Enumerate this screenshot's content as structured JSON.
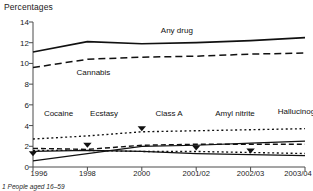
{
  "chart_data": {
    "type": "line",
    "title": "",
    "ylabel": "Percentages",
    "xlabel": "",
    "categories": [
      "1996",
      "1998",
      "2000",
      "2001/02",
      "2002/03",
      "2003/04"
    ],
    "ylim": [
      0,
      14
    ],
    "yticks": [
      0,
      2,
      4,
      6,
      8,
      10,
      12,
      14
    ],
    "grid": false,
    "legend": "inline-labels",
    "footnote": "1  People aged 16–59",
    "series": [
      {
        "name": "Any drug",
        "style": "solid",
        "values": [
          11.1,
          12.1,
          11.9,
          12.0,
          12.2,
          12.5
        ]
      },
      {
        "name": "Cannabis",
        "style": "dashed-long",
        "values": [
          9.6,
          10.4,
          10.6,
          10.7,
          10.9,
          11.0
        ]
      },
      {
        "name": "Cocaine",
        "style": "solid-rising",
        "values": [
          0.6,
          1.3,
          2.0,
          2.1,
          2.3,
          2.5
        ]
      },
      {
        "name": "Ecstasy",
        "style": "dashed",
        "values": [
          1.8,
          1.7,
          2.1,
          2.2,
          2.2,
          2.2
        ]
      },
      {
        "name": "Class A",
        "style": "dotted-top",
        "values": [
          2.7,
          3.0,
          3.4,
          3.5,
          3.6,
          3.7
        ]
      },
      {
        "name": "Amyl nitrite",
        "style": "dotted-low",
        "values": [
          1.6,
          1.6,
          1.5,
          1.5,
          1.4,
          1.3
        ]
      },
      {
        "name": "Hallucinogens",
        "style": "solid-falling",
        "values": [
          1.5,
          1.6,
          1.5,
          1.3,
          1.2,
          1.1
        ]
      }
    ],
    "markers": [
      {
        "series": "Cocaine",
        "x": "1996",
        "y": 1.05
      },
      {
        "series": "Ecstasy",
        "x": "1998",
        "y": 1.85
      },
      {
        "series": "Class A",
        "x": "2000",
        "y": 3.45
      },
      {
        "series": "Amyl nitrite",
        "x": "2001/02",
        "y": 1.6
      },
      {
        "series": "Hallucinogens",
        "x": "2002/03",
        "y": 1.3
      }
    ],
    "series_label_positions": [
      {
        "label": "Any drug",
        "x_pct": 47,
        "y_value": 13.05
      },
      {
        "label": "Cannabis",
        "x_pct": 16,
        "y_value": 9.0
      },
      {
        "label": "Cocaine",
        "x_pct": 4,
        "y_value": 5.0
      },
      {
        "label": "Ecstasy",
        "x_pct": 21,
        "y_value": 5.0
      },
      {
        "label": "Class A",
        "x_pct": 45,
        "y_value": 5.0
      },
      {
        "label": "Amyl nitrite",
        "x_pct": 67,
        "y_value": 5.0
      },
      {
        "label": "Hallucinogens",
        "x_pct": 90,
        "y_value": 5.2
      }
    ],
    "colors": {
      "line": "#111111",
      "axis": "#4a4a4a",
      "text": "#1a1a1a",
      "background": "#ffffff"
    }
  }
}
